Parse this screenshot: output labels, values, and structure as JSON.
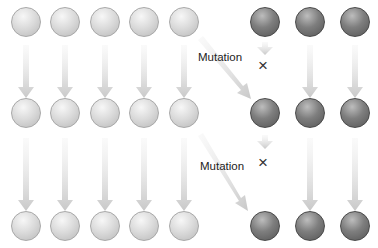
{
  "diagram": {
    "title": "",
    "rows": [
      {
        "generation": 1,
        "light_count": 5,
        "dark_count": 3
      },
      {
        "generation": 2,
        "light_count": 5,
        "dark_count": 3
      },
      {
        "generation": 3,
        "light_count": 5,
        "dark_count": 3
      }
    ],
    "annotations": [
      {
        "label": "Mutation",
        "mark": "×"
      },
      {
        "label": "Mutation",
        "mark": "×"
      }
    ],
    "colors": {
      "light_ball": "#d8d8d8",
      "dark_ball": "#707070",
      "arrow": "#d2d2d2",
      "text": "#222222"
    }
  }
}
